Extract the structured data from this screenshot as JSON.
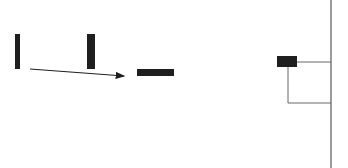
{
  "diagram": {
    "colors": {
      "fill": "#1f1f1f",
      "line": "#555555",
      "background": "#ffffff"
    },
    "shapes": [
      {
        "id": "bar-left",
        "orientation": "vertical",
        "x": 15,
        "y": 34,
        "w": 5,
        "h": 35
      },
      {
        "id": "bar-middle",
        "orientation": "vertical",
        "x": 87,
        "y": 34,
        "w": 8,
        "h": 35
      },
      {
        "id": "bar-horizontal",
        "orientation": "horizontal",
        "x": 137,
        "y": 69,
        "w": 37,
        "h": 7
      },
      {
        "id": "small-box",
        "orientation": "horizontal",
        "x": 277,
        "y": 56,
        "w": 20,
        "h": 11
      }
    ],
    "arrow": {
      "x1": 30,
      "y1": 69,
      "x2": 124,
      "y2": 76
    },
    "connector": {
      "vertical_axis_x": 331,
      "top_branch_y": 62,
      "bottom_branch_y": 103,
      "inner_x": 288
    }
  }
}
